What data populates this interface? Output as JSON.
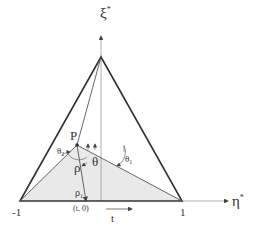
{
  "diagram": {
    "axes": {
      "vertical_label": "ξ",
      "vertical_sup": "*",
      "horizontal_label": "η",
      "horizontal_sup": "*"
    },
    "points": {
      "P": "P",
      "left_vertex": "-1",
      "right_vertex": "1",
      "base_point": "(t, 0)"
    },
    "symbols": {
      "theta": "θ",
      "theta1": "θ",
      "theta1_sub": "1",
      "theta2": "θ",
      "theta2_sub": "2",
      "rho": "ρ",
      "rho1": "ρ",
      "rho1_sub": "1",
      "t": "t"
    },
    "colors": {
      "triangle_stroke": "#333333",
      "shade_fill": "#e9e9e9",
      "line_stroke": "#555555"
    }
  }
}
